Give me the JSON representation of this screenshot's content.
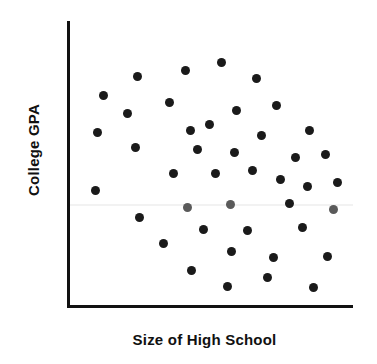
{
  "figure": {
    "width": 377,
    "height": 364,
    "background_color": "#ffffff"
  },
  "axes": {
    "line_color": "#111111",
    "y_axis_label": "College GPA",
    "x_axis_label": "Size of High School"
  },
  "chart_data": {
    "type": "scatter",
    "title": "",
    "xlabel": "Size of High School",
    "ylabel": "College GPA",
    "xlim": [
      0,
      100
    ],
    "ylim": [
      0,
      100
    ],
    "grid": false,
    "legend": null,
    "tick_labels": {
      "x": [],
      "y": []
    },
    "marker": {
      "shape": "circle",
      "diameter_px": 9,
      "color": "#1a1a1a",
      "faded_color": "#5a5a5a"
    },
    "n_points": 40,
    "points": [
      {
        "x": 12.6,
        "y": 74.0,
        "faded": false
      },
      {
        "x": 24.5,
        "y": 80.5,
        "faded": false
      },
      {
        "x": 41.3,
        "y": 82.5,
        "faded": false
      },
      {
        "x": 53.8,
        "y": 85.5,
        "faded": false
      },
      {
        "x": 66.1,
        "y": 80.0,
        "faded": false
      },
      {
        "x": 21.0,
        "y": 67.5,
        "faded": false
      },
      {
        "x": 35.7,
        "y": 71.5,
        "faded": false
      },
      {
        "x": 49.7,
        "y": 63.8,
        "faded": false
      },
      {
        "x": 59.1,
        "y": 68.5,
        "faded": false
      },
      {
        "x": 73.1,
        "y": 70.5,
        "faded": false
      },
      {
        "x": 10.5,
        "y": 61.0,
        "faded": false
      },
      {
        "x": 43.0,
        "y": 61.5,
        "faded": false
      },
      {
        "x": 68.0,
        "y": 60.0,
        "faded": false
      },
      {
        "x": 84.6,
        "y": 61.5,
        "faded": false
      },
      {
        "x": 23.8,
        "y": 55.5,
        "faded": false
      },
      {
        "x": 45.5,
        "y": 55.0,
        "faded": false
      },
      {
        "x": 58.4,
        "y": 54.0,
        "faded": false
      },
      {
        "x": 79.7,
        "y": 52.0,
        "faded": false
      },
      {
        "x": 90.2,
        "y": 53.0,
        "faded": false
      },
      {
        "x": 37.1,
        "y": 46.5,
        "faded": false
      },
      {
        "x": 51.8,
        "y": 46.5,
        "faded": false
      },
      {
        "x": 64.7,
        "y": 47.5,
        "faded": false
      },
      {
        "x": 74.5,
        "y": 44.5,
        "faded": false
      },
      {
        "x": 84.0,
        "y": 42.0,
        "faded": false
      },
      {
        "x": 94.4,
        "y": 43.5,
        "faded": false
      },
      {
        "x": 9.8,
        "y": 40.5,
        "faded": false
      },
      {
        "x": 42.0,
        "y": 34.5,
        "faded": true
      },
      {
        "x": 57.0,
        "y": 35.5,
        "faded": true
      },
      {
        "x": 77.6,
        "y": 36.0,
        "faded": false
      },
      {
        "x": 93.0,
        "y": 34.0,
        "faded": true
      },
      {
        "x": 25.2,
        "y": 31.0,
        "faded": false
      },
      {
        "x": 47.6,
        "y": 27.0,
        "faded": false
      },
      {
        "x": 62.9,
        "y": 26.5,
        "faded": false
      },
      {
        "x": 82.2,
        "y": 27.5,
        "faded": false
      },
      {
        "x": 33.6,
        "y": 22.0,
        "faded": false
      },
      {
        "x": 57.3,
        "y": 19.0,
        "faded": false
      },
      {
        "x": 72.0,
        "y": 17.0,
        "faded": false
      },
      {
        "x": 90.9,
        "y": 17.5,
        "faded": false
      },
      {
        "x": 43.4,
        "y": 12.5,
        "faded": false
      },
      {
        "x": 55.9,
        "y": 7.0,
        "faded": false
      },
      {
        "x": 69.9,
        "y": 10.0,
        "faded": false
      },
      {
        "x": 86.0,
        "y": 6.5,
        "faded": false
      }
    ]
  }
}
